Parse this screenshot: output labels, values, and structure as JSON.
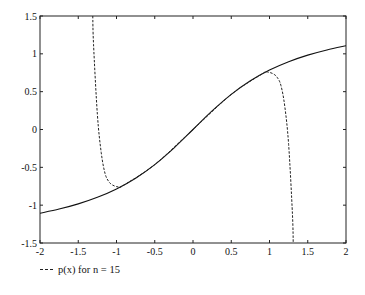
{
  "chart_data": {
    "type": "line",
    "title": "",
    "xlabel": "",
    "ylabel": "",
    "xlim": [
      -2,
      2
    ],
    "ylim": [
      -1.5,
      1.5
    ],
    "grid": false,
    "legend_position": "below-left",
    "x_ticks": [
      -2,
      -1.5,
      -1,
      -0.5,
      0,
      0.5,
      1,
      1.5,
      2
    ],
    "x_tick_labels": [
      "-2",
      "-1.5",
      "-1",
      "-0.5",
      "0",
      "0.5",
      "1",
      "1.5",
      "2"
    ],
    "y_ticks": [
      -1.5,
      -1,
      -0.5,
      0,
      0.5,
      1,
      1.5
    ],
    "y_tick_labels": [
      "-1.5",
      "-1",
      "-0.5",
      "0",
      "0.5",
      "1",
      "1.5"
    ],
    "series": [
      {
        "name": "arctan(x)",
        "style": "solid",
        "in_legend": false,
        "x": [
          -2,
          -1.75,
          -1.5,
          -1.25,
          -1,
          -0.75,
          -0.5,
          -0.25,
          0,
          0.25,
          0.5,
          0.75,
          1,
          1.25,
          1.5,
          1.75,
          2
        ],
        "y": [
          -1.1071,
          -1.0517,
          -0.9828,
          -0.8961,
          -0.7854,
          -0.6435,
          -0.4636,
          -0.245,
          0,
          0.245,
          0.4636,
          0.6435,
          0.7854,
          0.8961,
          0.9828,
          1.0517,
          1.1071
        ]
      },
      {
        "name": "p(x) for n = 15",
        "style": "dashed",
        "in_legend": true,
        "x": [
          -1.31,
          -1.3,
          -1.25,
          -1.2,
          -1.15,
          -1.1,
          -1.05,
          -1.0,
          -0.95,
          -0.9,
          -0.5,
          0,
          0.5,
          0.9,
          0.95,
          1.0,
          1.05,
          1.1,
          1.15,
          1.2,
          1.25,
          1.3,
          1.31
        ],
        "y": [
          1.5,
          1.1197,
          0.1979,
          -0.3035,
          -0.58,
          -0.6897,
          -0.735,
          -0.7543,
          -0.76,
          -0.7328,
          -0.4636,
          0,
          0.4636,
          0.7328,
          0.76,
          0.7543,
          0.735,
          0.6897,
          0.58,
          0.3035,
          -0.1979,
          -1.1197,
          -1.5
        ]
      }
    ]
  },
  "legend": {
    "entries": [
      {
        "label": "p(x) for n = 15",
        "style": "dashed"
      }
    ]
  }
}
